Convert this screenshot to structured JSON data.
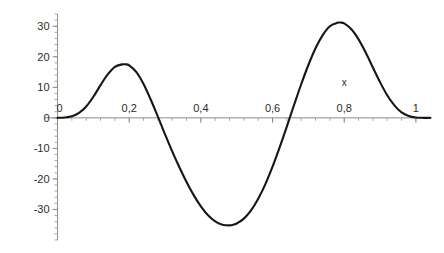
{
  "chart_data": {
    "type": "line",
    "title": "",
    "subtitle": "",
    "xlabel": "x",
    "ylabel": "",
    "xlim": [
      -0.035,
      1.045
    ],
    "ylim": [
      -40,
      34
    ],
    "grid": false,
    "legend": null,
    "x_ticks": [
      {
        "value": 0,
        "label": "0"
      },
      {
        "value": 0.2,
        "label": "0,2"
      },
      {
        "value": 0.4,
        "label": "0,4"
      },
      {
        "value": 0.6,
        "label": "0,6"
      },
      {
        "value": 0.8,
        "label": "0,8"
      },
      {
        "value": 1.0,
        "label": "1"
      }
    ],
    "x_minor_step": 0.04,
    "y_ticks": [
      {
        "value": 30,
        "label": "30"
      },
      {
        "value": 20,
        "label": "20"
      },
      {
        "value": 10,
        "label": "10"
      },
      {
        "value": 0,
        "label": "0"
      },
      {
        "value": -10,
        "label": "-10"
      },
      {
        "value": -20,
        "label": "-20"
      },
      {
        "value": -30,
        "label": "-30"
      }
    ],
    "y_minor_step": 2,
    "series": [
      {
        "name": "curve",
        "color": "#161616",
        "x": [
          0.0,
          0.02,
          0.04,
          0.06,
          0.08,
          0.1,
          0.12,
          0.14,
          0.16,
          0.18,
          0.19,
          0.2,
          0.22,
          0.24,
          0.26,
          0.28,
          0.29,
          0.3,
          0.32,
          0.34,
          0.36,
          0.38,
          0.4,
          0.42,
          0.44,
          0.46,
          0.48,
          0.49,
          0.5,
          0.52,
          0.54,
          0.56,
          0.58,
          0.6,
          0.62,
          0.64,
          0.66,
          0.68,
          0.7,
          0.72,
          0.74,
          0.76,
          0.78,
          0.79,
          0.8,
          0.82,
          0.84,
          0.86,
          0.88,
          0.9,
          0.92,
          0.94,
          0.96,
          0.98,
          1.0,
          1.02,
          1.04
        ],
        "y": [
          0.0,
          0.1,
          0.5,
          1.6,
          3.7,
          6.9,
          10.7,
          14.2,
          16.7,
          17.5,
          17.5,
          17.2,
          15.0,
          11.1,
          6.0,
          0.4,
          -2.5,
          -5.4,
          -11.0,
          -16.2,
          -21.0,
          -25.3,
          -29.0,
          -31.9,
          -33.9,
          -35.0,
          -35.2,
          -35.0,
          -34.6,
          -33.0,
          -30.3,
          -26.5,
          -21.7,
          -16.0,
          -9.6,
          -2.8,
          4.2,
          11.0,
          17.3,
          22.8,
          27.1,
          30.0,
          31.1,
          31.2,
          30.9,
          29.0,
          25.7,
          21.4,
          16.5,
          11.7,
          7.4,
          4.1,
          1.8,
          0.6,
          0.1,
          0.0,
          0.0
        ]
      }
    ],
    "annotations": [
      {
        "name": "x-axis-title",
        "text": "x",
        "x": 0.8,
        "y_px": 86
      }
    ]
  },
  "axis_label_origin": {
    "x_zero": "0",
    "y_zero": "0"
  },
  "colors": {
    "curve": "#161616",
    "axis": "#8c8c8c",
    "tick_minor": "#a8a8a8",
    "text": "#2b2b2b",
    "background": "#ffffff"
  }
}
